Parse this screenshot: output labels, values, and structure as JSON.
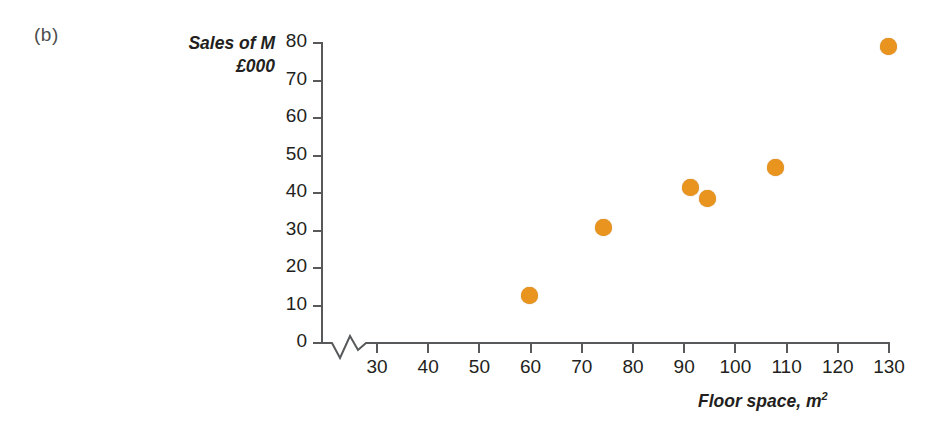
{
  "figure": {
    "panel_label": "(b)",
    "marker_color": "#e8941f",
    "axis_color": "#58595b",
    "text_color": "#231f20"
  },
  "chart_data": {
    "type": "scatter",
    "title": "",
    "subtitle": "",
    "xlabel": "Floor space, m",
    "xlabel_sup": "2",
    "ylabel_line1": "Sales of M",
    "ylabel_line2": "£000",
    "x": [
      60,
      74.5,
      91.5,
      94.7,
      108,
      130
    ],
    "y": [
      12.3,
      30.5,
      41.2,
      38.3,
      46.5,
      78.7
    ],
    "points": [
      {
        "x": 60,
        "y": 12.3
      },
      {
        "x": 74.5,
        "y": 30.5
      },
      {
        "x": 91.5,
        "y": 41.2
      },
      {
        "x": 94.7,
        "y": 38.3
      },
      {
        "x": 108,
        "y": 46.5
      },
      {
        "x": 130,
        "y": 78.7
      }
    ],
    "xlim": [
      25,
      133
    ],
    "ylim": [
      0,
      80
    ],
    "xticks": [
      30,
      40,
      50,
      60,
      70,
      80,
      90,
      100,
      110,
      120,
      130
    ],
    "yticks": [
      0,
      10,
      20,
      30,
      40,
      50,
      60,
      70,
      80
    ],
    "xtick_labels": [
      "30",
      "40",
      "50",
      "60",
      "70",
      "80",
      "90",
      "100",
      "110",
      "120",
      "130"
    ],
    "ytick_labels": [
      "0",
      "10",
      "20",
      "30",
      "40",
      "50",
      "60",
      "70",
      "80"
    ],
    "grid": false,
    "legend": false,
    "axis_break_x": true,
    "marker_color": "#e8941f",
    "marker_size": 17
  }
}
